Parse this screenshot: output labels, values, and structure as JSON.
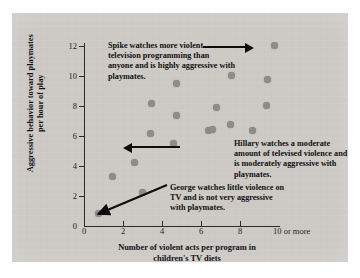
{
  "chart_data": {
    "type": "scatter",
    "title": "",
    "xlabel": "Number of violent acts per program in children's TV diets",
    "ylabel": "Aggressive behavior toward playmates per hour of play",
    "xlim": [
      0,
      10
    ],
    "ylim": [
      0,
      12
    ],
    "grid": false,
    "legend": "none",
    "xticks": [
      "0",
      "2",
      "4",
      "6",
      "8",
      "10 or more"
    ],
    "xtick_values": [
      0,
      2,
      4,
      6,
      8,
      10
    ],
    "yticks": [
      "0",
      "2",
      "4",
      "6",
      "8",
      "10",
      "12"
    ],
    "ytick_values": [
      0,
      2,
      4,
      6,
      8,
      10,
      12
    ],
    "marker_color": "#8e8c8a",
    "points": [
      {
        "x": 0.75,
        "y": 0.85,
        "label": "George"
      },
      {
        "x": 1.45,
        "y": 3.3,
        "label": ""
      },
      {
        "x": 2.6,
        "y": 4.25,
        "label": ""
      },
      {
        "x": 3.0,
        "y": 2.25,
        "label": ""
      },
      {
        "x": 3.4,
        "y": 6.2,
        "label": ""
      },
      {
        "x": 3.45,
        "y": 8.2,
        "label": ""
      },
      {
        "x": 4.6,
        "y": 5.5,
        "label": "Hillary"
      },
      {
        "x": 4.75,
        "y": 7.35,
        "label": ""
      },
      {
        "x": 4.75,
        "y": 9.5,
        "label": ""
      },
      {
        "x": 6.4,
        "y": 6.4,
        "label": ""
      },
      {
        "x": 6.6,
        "y": 6.45,
        "label": ""
      },
      {
        "x": 6.8,
        "y": 7.9,
        "label": ""
      },
      {
        "x": 7.5,
        "y": 6.8,
        "label": ""
      },
      {
        "x": 7.55,
        "y": 10.05,
        "label": ""
      },
      {
        "x": 8.65,
        "y": 6.35,
        "label": ""
      },
      {
        "x": 9.35,
        "y": 8.05,
        "label": ""
      },
      {
        "x": 9.4,
        "y": 9.75,
        "label": ""
      },
      {
        "x": 9.75,
        "y": 12.05,
        "label": "Spike"
      }
    ],
    "annotations": [
      {
        "name": "spike",
        "text": "Spike watches more violent television programming than anyone and is highly aggressive with playmates.",
        "points_to": "Spike"
      },
      {
        "name": "hillary",
        "text": "Hillary watches a moderate amount of televised violence and is moderately aggressive with playmates.",
        "points_to": "Hillary"
      },
      {
        "name": "george",
        "text": "George watches little violence on TV and is not very aggressive with playmates.",
        "points_to": "George"
      }
    ]
  },
  "axis": {
    "x_title_line1": "Number of violent acts per program in",
    "x_title_line2": "children's TV diets",
    "y_title_line1": "Aggressive behavior toward playmates",
    "y_title_line2": "per hour of play"
  },
  "colors": {
    "panel_background": "#cdcac6",
    "marker": "#8e8c8a",
    "axis": "#2b2b2b",
    "text": "#101010",
    "page_background": "#fefefe"
  }
}
